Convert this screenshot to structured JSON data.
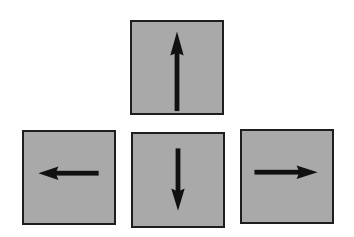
{
  "diagram": {
    "title": "Arrow keys",
    "colors": {
      "key_fill": "#a9a9a9",
      "key_border": "#1e1e1e",
      "arrow": "#111111",
      "background": "#ffffff"
    },
    "keys": [
      {
        "id": "up",
        "label": "Up arrow key",
        "icon": "arrow-up-icon",
        "direction": "up"
      },
      {
        "id": "left",
        "label": "Left arrow key",
        "icon": "arrow-left-icon",
        "direction": "left"
      },
      {
        "id": "down",
        "label": "Down arrow key",
        "icon": "arrow-down-icon",
        "direction": "down"
      },
      {
        "id": "right",
        "label": "Right arrow key",
        "icon": "arrow-right-icon",
        "direction": "right"
      }
    ]
  }
}
